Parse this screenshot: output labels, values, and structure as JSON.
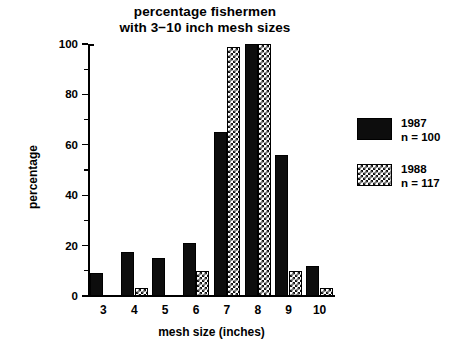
{
  "chart_data": {
    "type": "bar",
    "title": "percentage fishermen with 3−10 inch mesh sizes",
    "title_lines": [
      "percentage fishermen",
      "with 3−10 inch mesh sizes"
    ],
    "xlabel": "mesh size (inches)",
    "ylabel": "percentage",
    "categories": [
      "3",
      "4",
      "5",
      "6",
      "7",
      "8",
      "9",
      "10"
    ],
    "ylim": [
      0,
      100
    ],
    "yticks": [
      0,
      20,
      40,
      60,
      80,
      100
    ],
    "ytick_labels": [
      "0",
      "20",
      "40",
      "60",
      "80",
      "100"
    ],
    "yminor_ticks": [
      10,
      30,
      50,
      70,
      90
    ],
    "grid": false,
    "legend_position": "right",
    "series": [
      {
        "name": "1987",
        "sublabel": "n = 100",
        "color": "#0d0d0d",
        "pattern": "solid",
        "values": [
          9,
          17.5,
          15,
          21,
          65,
          100,
          56,
          12
        ]
      },
      {
        "name": "1988",
        "sublabel": "n = 117",
        "color": "#111111",
        "pattern": "checkerboard",
        "values": [
          0,
          3,
          0,
          10,
          99,
          100,
          10,
          3
        ]
      }
    ]
  },
  "legend": {
    "entries": [
      {
        "label": "1987",
        "sublabel": "n = 100"
      },
      {
        "label": "1988",
        "sublabel": "n = 117"
      }
    ]
  }
}
